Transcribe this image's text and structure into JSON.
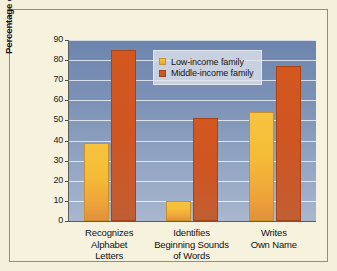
{
  "chart_data": {
    "type": "bar",
    "title": "",
    "subtitle": "",
    "xlabel": "",
    "ylabel": "Percentage of Kindergartners",
    "ylim": [
      0,
      90
    ],
    "ytick_step": 10,
    "yticks": [
      "90",
      "80",
      "70",
      "60",
      "50",
      "40",
      "30",
      "20",
      "10",
      "0"
    ],
    "grid": "horizontal",
    "legend_position": "top-center",
    "categories": [
      "Recognizes Alphabet Letters",
      "Identifies Beginning Sounds of Words",
      "Writes Own Name"
    ],
    "category_lines": [
      [
        "Recognizes",
        "Alphabet",
        "Letters"
      ],
      [
        "Identifies",
        "Beginning Sounds",
        "of Words"
      ],
      [
        "Writes",
        "Own Name"
      ]
    ],
    "series": [
      {
        "name": "Low-income family",
        "color": "#f2b63a",
        "values": [
          39,
          10,
          54
        ]
      },
      {
        "name": "Middle-income family",
        "color": "#cb5622",
        "values": [
          85,
          51,
          77
        ]
      }
    ]
  },
  "legend": {
    "items": [
      {
        "label": "Low-income family"
      },
      {
        "label": "Middle-income family"
      }
    ]
  },
  "colors": {
    "page_background": "#f4f0dc",
    "frame_border": "#8e8d86",
    "plot_background_top": "#6d85ae",
    "plot_background_bottom": "#a9b7cf",
    "gridline": "#ffffff",
    "axis": "#5d5d5d",
    "low_income": "#f2b63a",
    "middle_income": "#cb5622",
    "text": "#111111"
  }
}
